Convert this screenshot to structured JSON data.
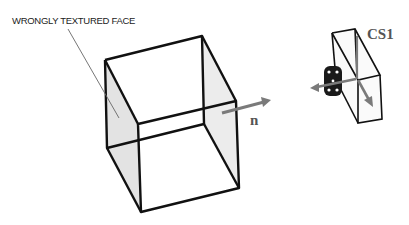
{
  "diagram": {
    "annotation_label": "WRONGLY TEXTURED FACE",
    "normal_label": "n",
    "coord_system_label": "CS1",
    "colors": {
      "edges": "#111111",
      "shaded_face": "#e3e3e3",
      "arrow": "#7a7a7a",
      "label_text": "#555555"
    }
  }
}
